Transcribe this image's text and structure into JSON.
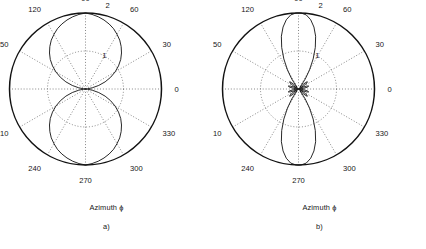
{
  "figure": {
    "background": "#ffffff",
    "line_color": "#111111",
    "grid_color": "#555555"
  },
  "panels": [
    {
      "id": "a",
      "subcaption": "a)",
      "axis_label": "Azimuth ϕ",
      "chart_data": {
        "type": "line",
        "plot_kind": "polar",
        "title": "",
        "xlabel": "Azimuth ϕ",
        "ylabel": "",
        "subcaption": "a)",
        "angle_unit": "degrees",
        "theta_direction": "counterclockwise",
        "theta_zero_location": "E",
        "angle_tick_labels": [
          "0",
          "30",
          "60",
          "90",
          "120",
          "150",
          "180",
          "210",
          "240",
          "270",
          "300",
          "330"
        ],
        "angle_ticks": [
          0,
          30,
          60,
          90,
          120,
          150,
          180,
          210,
          240,
          270,
          300,
          330
        ],
        "radial_ticks": [
          1,
          2
        ],
        "radial_tick_labels": [
          "1",
          "2"
        ],
        "rlim": [
          0,
          2
        ],
        "grid": true,
        "legend": "none",
        "series": [
          {
            "name": "pattern-a",
            "description": "broad figure-eight lobe pair, maxima at 90 and 270 degrees, nulls at 0 and 180 degrees",
            "theta": [
              0,
              5,
              10,
              15,
              20,
              25,
              30,
              35,
              40,
              45,
              50,
              55,
              60,
              65,
              70,
              75,
              80,
              85,
              90,
              95,
              100,
              105,
              110,
              115,
              120,
              125,
              130,
              135,
              140,
              145,
              150,
              155,
              160,
              165,
              170,
              175,
              180,
              185,
              190,
              195,
              200,
              205,
              210,
              215,
              220,
              225,
              230,
              235,
              240,
              245,
              250,
              255,
              260,
              265,
              270,
              275,
              280,
              285,
              290,
              295,
              300,
              305,
              310,
              315,
              320,
              325,
              330,
              335,
              340,
              345,
              350,
              355,
              360
            ],
            "r": [
              0.0,
              0.05,
              0.18,
              0.36,
              0.55,
              0.73,
              0.9,
              1.06,
              1.21,
              1.34,
              1.46,
              1.57,
              1.66,
              1.75,
              1.82,
              1.88,
              1.93,
              1.97,
              2.0,
              1.97,
              1.93,
              1.88,
              1.82,
              1.75,
              1.66,
              1.57,
              1.46,
              1.34,
              1.21,
              1.06,
              0.9,
              0.73,
              0.55,
              0.36,
              0.18,
              0.05,
              0.0,
              0.05,
              0.18,
              0.36,
              0.55,
              0.73,
              0.9,
              1.06,
              1.21,
              1.34,
              1.46,
              1.57,
              1.66,
              1.75,
              1.82,
              1.88,
              1.93,
              1.97,
              2.0,
              1.97,
              1.93,
              1.88,
              1.82,
              1.75,
              1.66,
              1.57,
              1.46,
              1.34,
              1.21,
              1.06,
              0.9,
              0.73,
              0.55,
              0.36,
              0.18,
              0.05,
              0.0
            ]
          }
        ]
      }
    },
    {
      "id": "b",
      "subcaption": "b)",
      "axis_label": "Azimuth ϕ",
      "chart_data": {
        "type": "line",
        "plot_kind": "polar",
        "title": "",
        "xlabel": "Azimuth ϕ",
        "ylabel": "",
        "subcaption": "b)",
        "angle_unit": "degrees",
        "theta_direction": "counterclockwise",
        "theta_zero_location": "E",
        "angle_tick_labels": [
          "0",
          "30",
          "60",
          "90",
          "120",
          "150",
          "180",
          "210",
          "240",
          "270",
          "300",
          "330"
        ],
        "angle_ticks": [
          0,
          30,
          60,
          90,
          120,
          150,
          180,
          210,
          240,
          270,
          300,
          330
        ],
        "radial_ticks": [
          1,
          2
        ],
        "radial_tick_labels": [
          "1",
          "2"
        ],
        "rlim": [
          0,
          2
        ],
        "grid": true,
        "legend": "none",
        "series": [
          {
            "name": "pattern-b",
            "description": "narrow main lobes at 90 and 270 degrees with small sidelobes near the origin",
            "theta": [
              0,
              4,
              8,
              12,
              16,
              20,
              24,
              28,
              32,
              36,
              40,
              44,
              48,
              52,
              56,
              60,
              64,
              68,
              72,
              76,
              80,
              84,
              88,
              90,
              92,
              96,
              100,
              104,
              108,
              112,
              116,
              120,
              124,
              128,
              132,
              136,
              140,
              144,
              148,
              152,
              156,
              160,
              164,
              168,
              172,
              176,
              180,
              184,
              188,
              192,
              196,
              200,
              204,
              208,
              212,
              216,
              220,
              224,
              228,
              232,
              236,
              240,
              244,
              248,
              252,
              256,
              260,
              264,
              268,
              270,
              272,
              276,
              280,
              284,
              288,
              292,
              296,
              300,
              304,
              308,
              312,
              316,
              320,
              324,
              328,
              332,
              336,
              340,
              344,
              348,
              352,
              356,
              360
            ],
            "r": [
              0.0,
              0.04,
              0.14,
              0.24,
              0.28,
              0.22,
              0.09,
              0.03,
              0.16,
              0.28,
              0.3,
              0.2,
              0.05,
              0.1,
              0.32,
              0.58,
              0.88,
              1.18,
              1.46,
              1.68,
              1.85,
              1.96,
              2.0,
              2.0,
              2.0,
              1.96,
              1.85,
              1.68,
              1.46,
              1.18,
              0.88,
              0.58,
              0.32,
              0.1,
              0.05,
              0.2,
              0.3,
              0.28,
              0.16,
              0.03,
              0.09,
              0.22,
              0.28,
              0.24,
              0.14,
              0.04,
              0.0,
              0.04,
              0.14,
              0.24,
              0.28,
              0.22,
              0.09,
              0.03,
              0.16,
              0.28,
              0.3,
              0.2,
              0.05,
              0.1,
              0.32,
              0.58,
              0.88,
              1.18,
              1.46,
              1.68,
              1.85,
              1.96,
              2.0,
              2.0,
              2.0,
              1.96,
              1.85,
              1.68,
              1.46,
              1.18,
              0.88,
              0.58,
              0.32,
              0.1,
              0.05,
              0.2,
              0.3,
              0.28,
              0.16,
              0.03,
              0.09,
              0.22,
              0.28,
              0.24,
              0.14,
              0.04,
              0.0
            ]
          }
        ]
      }
    }
  ]
}
